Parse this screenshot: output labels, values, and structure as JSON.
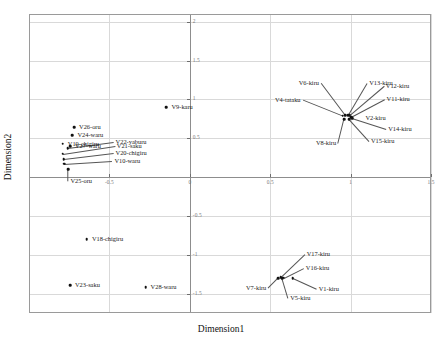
{
  "chart_data": {
    "type": "scatter",
    "title": "",
    "xlabel": "Dimension1",
    "ylabel": "Dimension2",
    "xlim": [
      -1.0,
      1.5
    ],
    "ylim": [
      -1.75,
      2.1
    ],
    "grid": true,
    "legend": "none",
    "xticks": [
      -0.5,
      0,
      0.5,
      1,
      1.5
    ],
    "xtick_labels": [
      "-0.5",
      "0",
      "0.5",
      "1",
      "1.5"
    ],
    "yticks": [
      -1.5,
      -1,
      -0.5,
      0,
      0.5,
      1,
      1.5,
      2
    ],
    "ytick_labels": [
      "-1.5",
      "-1",
      "-0.5",
      "0",
      "0.5",
      "1",
      "1.5",
      "2"
    ],
    "points": [
      {
        "label": "V9-karu",
        "x": -0.145,
        "y": 0.9,
        "label_pos": "left",
        "dx": 5,
        "dy": 0,
        "leader": false
      },
      {
        "label": "V26-oru",
        "x": -0.72,
        "y": 0.64,
        "label_pos": "left",
        "dx": 5,
        "dy": 0,
        "leader": false
      },
      {
        "label": "V24-waru",
        "x": -0.73,
        "y": 0.54,
        "label_pos": "left",
        "dx": 5,
        "dy": 0,
        "leader": false
      },
      {
        "label": "V19-chigiru",
        "x": -0.79,
        "y": 0.43,
        "label_pos": "left",
        "dx": 5,
        "dy": 0,
        "leader": false
      },
      {
        "label": "V27-waru",
        "x": -0.745,
        "y": 0.4,
        "label_pos": "left",
        "dx": 5,
        "dy": 0,
        "leader": false
      },
      {
        "label": "V22-yaburu",
        "x": -0.76,
        "y": 0.37,
        "label_pos": "left",
        "dx": 48,
        "dy": -6,
        "leader": true
      },
      {
        "label": "V21-saku",
        "x": -0.79,
        "y": 0.3,
        "label_pos": "left",
        "dx": 54,
        "dy": -8,
        "leader": true
      },
      {
        "label": "V20-chigiru",
        "x": -0.785,
        "y": 0.23,
        "label_pos": "left",
        "dx": 52,
        "dy": -6,
        "leader": true
      },
      {
        "label": "V10-waru",
        "x": -0.78,
        "y": 0.175,
        "label_pos": "left",
        "dx": 50,
        "dy": -3,
        "leader": true
      },
      {
        "label": "V25-oru",
        "x": -0.755,
        "y": 0.105,
        "label_pos": "left",
        "dx": 2,
        "dy": 12,
        "leader": true
      },
      {
        "label": "V18-chigiru",
        "x": -0.64,
        "y": -0.8,
        "label_pos": "left",
        "dx": 5,
        "dy": 0,
        "leader": false
      },
      {
        "label": "V23-saku",
        "x": -0.745,
        "y": -1.39,
        "label_pos": "left",
        "dx": 5,
        "dy": 0,
        "leader": false
      },
      {
        "label": "V28-waru",
        "x": -0.275,
        "y": -1.42,
        "label_pos": "left",
        "dx": 5,
        "dy": 0,
        "leader": false
      },
      {
        "label": "V6-kiru",
        "x": 0.965,
        "y": 0.8,
        "label_pos": "right",
        "dx": -26,
        "dy": -32,
        "leader": true
      },
      {
        "label": "V4-tataku",
        "x": 0.95,
        "y": 0.79,
        "label_pos": "right",
        "dx": -42,
        "dy": -16,
        "leader": true
      },
      {
        "label": "V13-kiru",
        "x": 0.985,
        "y": 0.8,
        "label_pos": "left",
        "dx": 21,
        "dy": -32,
        "leader": true
      },
      {
        "label": "V12-kiru",
        "x": 0.995,
        "y": 0.795,
        "label_pos": "left",
        "dx": 36,
        "dy": -29,
        "leader": true
      },
      {
        "label": "V11-kiru",
        "x": 1.0,
        "y": 0.78,
        "label_pos": "left",
        "dx": 36,
        "dy": -18,
        "leader": true
      },
      {
        "label": "V2-kiru",
        "x": 1.005,
        "y": 0.77,
        "label_pos": "left",
        "dx": 14,
        "dy": 1,
        "leader": false
      },
      {
        "label": "V14-kiru",
        "x": 1.01,
        "y": 0.755,
        "label_pos": "left",
        "dx": 36,
        "dy": 11,
        "leader": true
      },
      {
        "label": "V15-kiru",
        "x": 0.99,
        "y": 0.745,
        "label_pos": "left",
        "dx": 22,
        "dy": 22,
        "leader": true
      },
      {
        "label": "V8-kiru",
        "x": 0.96,
        "y": 0.745,
        "label_pos": "right",
        "dx": -8,
        "dy": 24,
        "leader": true
      },
      {
        "label": "V17-kiru",
        "x": 0.565,
        "y": -1.29,
        "label_pos": "left",
        "dx": 26,
        "dy": -23,
        "leader": true
      },
      {
        "label": "V16-kiru",
        "x": 0.585,
        "y": -1.295,
        "label_pos": "left",
        "dx": 22,
        "dy": -10,
        "leader": true
      },
      {
        "label": "V1-kiru",
        "x": 0.64,
        "y": -1.3,
        "label_pos": "left",
        "dx": 26,
        "dy": 11,
        "leader": true
      },
      {
        "label": "V5-kiru",
        "x": 0.575,
        "y": -1.305,
        "label_pos": "left",
        "dx": 8,
        "dy": 20,
        "leader": true
      },
      {
        "label": "V7-kiru",
        "x": 0.55,
        "y": -1.3,
        "label_pos": "right",
        "dx": -12,
        "dy": 10,
        "leader": true
      }
    ]
  }
}
